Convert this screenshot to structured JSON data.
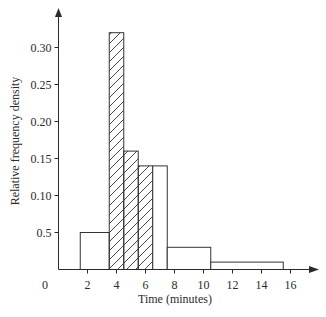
{
  "chart_data": {
    "type": "bar",
    "subtype": "histogram",
    "title": "",
    "xlabel": "Time (minutes)",
    "ylabel": "Relative frequency density",
    "xlim": [
      0,
      17.5
    ],
    "ylim": [
      0,
      0.34
    ],
    "grid": false,
    "legend": null,
    "x_ticks": [
      {
        "value": 0,
        "label": "0"
      },
      {
        "value": 2,
        "label": "2"
      },
      {
        "value": 4,
        "label": "4"
      },
      {
        "value": 6,
        "label": "6"
      },
      {
        "value": 8,
        "label": "8"
      },
      {
        "value": 10,
        "label": "10"
      },
      {
        "value": 12,
        "label": "12"
      },
      {
        "value": 14,
        "label": "14"
      },
      {
        "value": 16,
        "label": "16"
      }
    ],
    "y_ticks": [
      {
        "value": 0.05,
        "label": "0.5"
      },
      {
        "value": 0.1,
        "label": "0.10"
      },
      {
        "value": 0.15,
        "label": "0.15"
      },
      {
        "value": 0.2,
        "label": "0.20"
      },
      {
        "value": 0.25,
        "label": "0.25"
      },
      {
        "value": 0.3,
        "label": "0.30"
      }
    ],
    "bins": [
      {
        "start": 1.5,
        "end": 3.5,
        "density": 0.05,
        "hatched": false
      },
      {
        "start": 3.5,
        "end": 4.5,
        "density": 0.32,
        "hatched": true
      },
      {
        "start": 4.5,
        "end": 5.5,
        "density": 0.16,
        "hatched": true
      },
      {
        "start": 5.5,
        "end": 6.5,
        "density": 0.14,
        "hatched": true
      },
      {
        "start": 6.5,
        "end": 7.5,
        "density": 0.14,
        "hatched": false
      },
      {
        "start": 7.5,
        "end": 10.5,
        "density": 0.03,
        "hatched": false
      },
      {
        "start": 10.5,
        "end": 15.5,
        "density": 0.01,
        "hatched": false
      }
    ],
    "colors": {
      "axis": "#2a2a2a",
      "bar_stroke": "#333333",
      "bar_fill": "#ffffff",
      "hatch": "#333333"
    }
  }
}
